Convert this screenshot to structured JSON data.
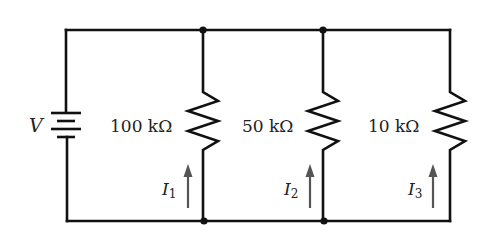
{
  "diagram": {
    "type": "parallel-resistor-circuit",
    "colors": {
      "wire": "#111111",
      "arrow": "#555555",
      "text": "#222222",
      "background": "#ffffff"
    },
    "source": {
      "label": "V",
      "symbol": "battery-icon"
    },
    "branches": [
      {
        "resistance": "100 kΩ",
        "current_symbol": "I",
        "current_index": "1"
      },
      {
        "resistance": "50 kΩ",
        "current_symbol": "I",
        "current_index": "2"
      },
      {
        "resistance": "10 kΩ",
        "current_symbol": "I",
        "current_index": "3"
      }
    ],
    "current_direction": "up"
  }
}
